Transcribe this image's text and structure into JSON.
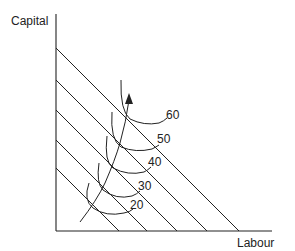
{
  "axes": {
    "y_label": "Capital",
    "x_label": "Labour"
  },
  "isoquants": [
    {
      "label": "20"
    },
    {
      "label": "30"
    },
    {
      "label": "40"
    },
    {
      "label": "50"
    },
    {
      "label": "60"
    }
  ],
  "isocost_lines_count": 5,
  "expansion_path": {
    "arrow": "up"
  },
  "colors": {
    "line": "#222222",
    "background": "#ffffff"
  }
}
